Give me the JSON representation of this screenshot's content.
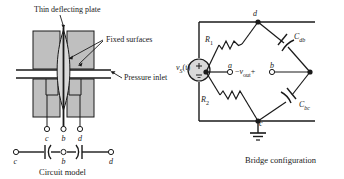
{
  "figure": {
    "left_panel": {
      "caption": "Circuit model",
      "annotations": [
        {
          "id": "thin-deflecting-plate",
          "text": "Thin deflecting plate"
        },
        {
          "id": "fixed-surfaces",
          "text": "Fixed surfaces"
        },
        {
          "id": "pressure-inlet",
          "text": "Pressure inlet"
        }
      ],
      "sensor_terminals": [
        {
          "id": "c",
          "label": "c"
        },
        {
          "id": "b",
          "label": "b"
        },
        {
          "id": "d",
          "label": "d"
        }
      ],
      "circuit_model_terminals": [
        {
          "id": "c",
          "label": "c"
        },
        {
          "id": "b",
          "label": "b"
        },
        {
          "id": "d",
          "label": "d"
        }
      ],
      "circuit_model_elements": [
        {
          "id": "cap-cb",
          "type": "capacitor"
        },
        {
          "id": "cap-bd",
          "type": "capacitor"
        }
      ]
    },
    "right_panel": {
      "caption": "Bridge configuration",
      "source": {
        "id": "vs",
        "label": "v",
        "subscript": "S",
        "arg": "(t)",
        "plus": "+",
        "minus": "−",
        "type": "ac-voltage-source"
      },
      "nodes": [
        {
          "id": "d",
          "label": "d"
        },
        {
          "id": "a",
          "label": "a"
        },
        {
          "id": "b",
          "label": "b"
        },
        {
          "id": "c",
          "label": "c"
        }
      ],
      "branches": [
        {
          "id": "r1",
          "label": "R",
          "subscript": "1",
          "type": "resistor"
        },
        {
          "id": "cdb",
          "label": "C",
          "subscript": "db",
          "type": "capacitor"
        },
        {
          "id": "r2",
          "label": "R",
          "subscript": "2",
          "type": "resistor"
        },
        {
          "id": "cbc",
          "label": "C",
          "subscript": "bc",
          "type": "capacitor"
        }
      ],
      "output": {
        "id": "vout",
        "minus": "−",
        "label": "v",
        "subscript": "out",
        "plus": "+"
      },
      "ground": {
        "id": "ground",
        "type": "earth-ground"
      }
    }
  },
  "colors": {
    "line": "#1a1a1a",
    "fill_gray": "#bfbfbf",
    "fill_light": "#d9d9d9",
    "background": "#ffffff",
    "text": "#1a1a1a"
  }
}
